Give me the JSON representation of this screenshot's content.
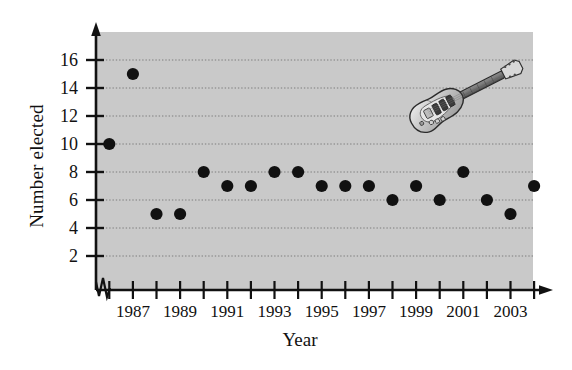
{
  "chart_data": {
    "type": "scatter",
    "title": "",
    "xlabel": "Year",
    "ylabel": "Number elected",
    "x": [
      1986,
      1987,
      1988,
      1989,
      1990,
      1991,
      1992,
      1993,
      1994,
      1995,
      1996,
      1997,
      1998,
      1999,
      2000,
      2001,
      2002,
      2003,
      2004
    ],
    "values": [
      10,
      15,
      5,
      5,
      8,
      7,
      7,
      8,
      8,
      7,
      7,
      7,
      6,
      7,
      6,
      8,
      6,
      5,
      7
    ],
    "xlim": [
      1986,
      2004
    ],
    "ylim": [
      0,
      17
    ],
    "y_ticks": [
      2,
      4,
      6,
      8,
      10,
      12,
      14,
      16
    ],
    "y_tick_labels": [
      "2",
      "4",
      "6",
      "8",
      "10",
      "12",
      "14",
      "16"
    ],
    "x_ticks": [
      1986,
      1987,
      1988,
      1989,
      1990,
      1991,
      1992,
      1993,
      1994,
      1995,
      1996,
      1997,
      1998,
      1999,
      2000,
      2001,
      2002,
      2003,
      2004
    ],
    "x_tick_labels": [
      "",
      "1987",
      "",
      "1989",
      "",
      "1991",
      "",
      "1993",
      "",
      "1995",
      "",
      "1997",
      "",
      "1999",
      "",
      "2001",
      "",
      "2003",
      ""
    ],
    "grid": "horizontal-dotted",
    "legend": "none",
    "axis_break": "x-axis-origin-zigzag",
    "marker_color": "#111111",
    "plot_background_color": "#c9c9c9",
    "grid_color": "#8a8a8a",
    "axis_color": "#111111",
    "decoration": "electric-guitar-illustration"
  },
  "axes": {
    "y_title": "Number elected",
    "x_title": "Year"
  }
}
